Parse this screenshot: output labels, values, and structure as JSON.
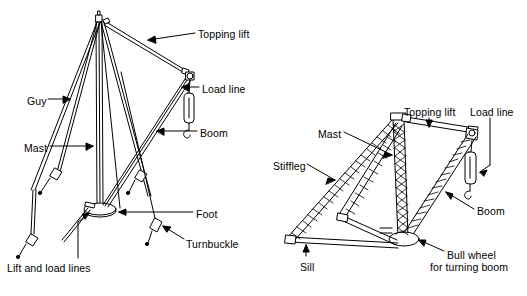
{
  "figure": {
    "type": "technical-line-diagram",
    "background_color": "#ffffff",
    "line_color": "#000000",
    "diagrams": [
      {
        "id": "guy-derrick",
        "name": "Guy derrick",
        "labels": [
          {
            "key": "topping_lift",
            "text": "Topping lift",
            "x": 198,
            "y": 28,
            "align": "left"
          },
          {
            "key": "load_line",
            "text": "Load line",
            "x": 202,
            "y": 83,
            "align": "left"
          },
          {
            "key": "boom",
            "text": "Boom",
            "x": 200,
            "y": 127,
            "align": "left"
          },
          {
            "key": "guy",
            "text": "Guy",
            "x": 27,
            "y": 95,
            "align": "left"
          },
          {
            "key": "mast",
            "text": "Mast",
            "x": 24,
            "y": 142,
            "align": "left"
          },
          {
            "key": "foot",
            "text": "Foot",
            "x": 196,
            "y": 208,
            "align": "left"
          },
          {
            "key": "turnbuckle",
            "text": "Turnbuckle",
            "x": 186,
            "y": 238,
            "align": "left"
          },
          {
            "key": "lift_and_load_lines",
            "text": "Lift and load lines",
            "x": 7,
            "y": 262,
            "align": "left"
          }
        ]
      },
      {
        "id": "stiffleg-derrick",
        "name": "Stiffleg derrick",
        "labels": [
          {
            "key": "topping_lift",
            "text": "Topping lift",
            "x": 404,
            "y": 106,
            "align": "left"
          },
          {
            "key": "load_line",
            "text": "Load line",
            "x": 470,
            "y": 106,
            "align": "left"
          },
          {
            "key": "mast",
            "text": "Mast",
            "x": 318,
            "y": 128,
            "align": "left"
          },
          {
            "key": "stiffleg",
            "text": "Stiffleg",
            "x": 273,
            "y": 160,
            "align": "left"
          },
          {
            "key": "boom",
            "text": "Boom",
            "x": 477,
            "y": 205,
            "align": "left"
          },
          {
            "key": "sill",
            "text": "Sill",
            "x": 300,
            "y": 261,
            "align": "left"
          },
          {
            "key": "bull_wheel_line1",
            "text": "Bull wheel",
            "x": 447,
            "y": 249,
            "align": "left"
          },
          {
            "key": "bull_wheel_line2",
            "text": "for turning boom",
            "x": 430,
            "y": 261,
            "align": "left"
          }
        ]
      }
    ]
  }
}
